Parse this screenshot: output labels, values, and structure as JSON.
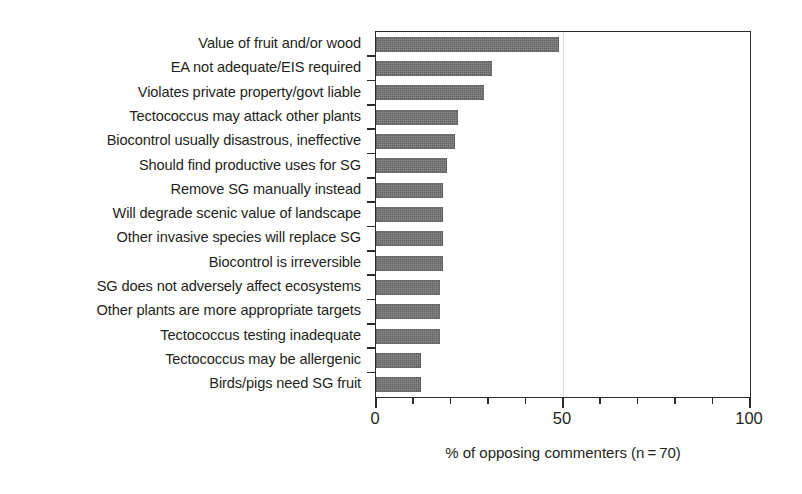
{
  "chart_data": {
    "type": "bar",
    "orientation": "horizontal",
    "title": "",
    "xlabel": "% of opposing commenters (n = 70)",
    "ylabel": "",
    "xlim": [
      0,
      100
    ],
    "xticks": [
      0,
      10,
      20,
      30,
      40,
      50,
      60,
      70,
      80,
      90,
      100
    ],
    "xtick_labels": [
      "0",
      "50",
      "100"
    ],
    "xtick_label_values": [
      0,
      50,
      100
    ],
    "grid": "single vertical gridline at 50",
    "legend": "none",
    "annotation": {
      "lines": [
        "Reasons cited",
        "by opponents"
      ],
      "x": 50,
      "position": "inside plot, right of bars"
    },
    "bar_color": "#6e6e6e",
    "axis_color": "#2b2b2b",
    "categories": [
      "Value of fruit and/or wood",
      "EA not adequate/EIS required",
      "Violates private property/govt liable",
      "Tectococcus may attack other plants",
      "Biocontrol usually disastrous, ineffective",
      "Should find productive uses for SG",
      "Remove SG manually instead",
      "Will degrade scenic value of landscape",
      "Other invasive species will replace SG",
      "Biocontrol is irreversible",
      "SG does not adversely affect ecosystems",
      "Other plants are more appropriate targets",
      "Tectococcus testing inadequate",
      "Tectococcus may be allergenic",
      "Birds/pigs need SG fruit"
    ],
    "values": [
      49,
      31,
      29,
      22,
      21,
      19,
      18,
      18,
      18,
      18,
      17,
      17,
      17,
      12,
      12
    ],
    "n": 70
  }
}
